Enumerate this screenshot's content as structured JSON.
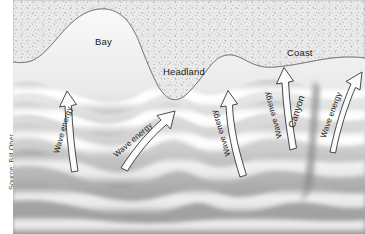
{
  "figure": {
    "credit": "Source: Bill Ober"
  },
  "labels": {
    "bay": "Bay",
    "headland": "Headland",
    "coast": "Coast",
    "canyon": "Canyon"
  },
  "arrows": [
    {
      "label": "Wave energy",
      "rotation": -74,
      "x": 63,
      "y": 130
    },
    {
      "label": "Wave energy",
      "rotation": -41,
      "x": 133,
      "y": 140
    },
    {
      "label": "Wave energy",
      "rotation": 253,
      "x": 221,
      "y": 133
    },
    {
      "label": "Wave energy",
      "rotation": 254,
      "x": 273,
      "y": 115
    },
    {
      "label": "Wave energy",
      "rotation": -70,
      "x": 331,
      "y": 115
    }
  ],
  "colors": {
    "land": "#e8e8e8",
    "land_speckle": "#9a9a9a",
    "water_light": "#ffffff",
    "water_mid": "#d2d2d2",
    "water_deep": "#9d9d9d",
    "outline": "#2b2b2b",
    "text": "#1b1b1b"
  }
}
